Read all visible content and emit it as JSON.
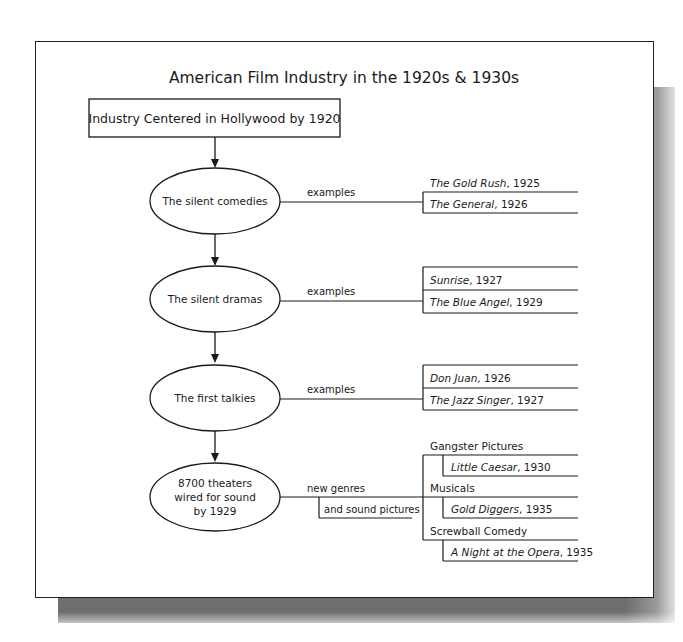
{
  "title": "American Film Industry in the 1920s & 1930s",
  "root": {
    "label": "Industry Centered in Hollywood by 1920"
  },
  "nodes": [
    {
      "label": "The silent comedies",
      "edge_label": "examples",
      "items": [
        {
          "title": "The Gold Rush",
          "year": ", 1925"
        },
        {
          "title": "The General",
          "year": ", 1926"
        }
      ]
    },
    {
      "label": "The silent dramas",
      "edge_label": "examples",
      "items": [
        {
          "title": "Sunrise",
          "year": ", 1927"
        },
        {
          "title": "The Blue Angel",
          "year": ", 1929"
        }
      ]
    },
    {
      "label": "The first talkies",
      "edge_label": "examples",
      "items": [
        {
          "title": "Don Juan",
          "year": ", 1926"
        },
        {
          "title": "The Jazz Singer",
          "year": ", 1927"
        }
      ]
    },
    {
      "label_lines": [
        "8700 theaters",
        "wired for sound",
        "by 1929"
      ],
      "edge_label": "new genres",
      "edge_sublabel": "and sound pictures",
      "genres": [
        {
          "name": "Gangster Pictures",
          "example_title": "Little Caesar",
          "example_year": ", 1930"
        },
        {
          "name": "Musicals",
          "example_title": "Gold Diggers",
          "example_year": ", 1935"
        },
        {
          "name": "Screwball Comedy",
          "example_title": "A Night at the Opera",
          "example_year": ", 1935"
        }
      ]
    }
  ],
  "colors": {
    "line": "#1a1a1a",
    "shadow": "#6e6e6e",
    "background": "#ffffff"
  }
}
